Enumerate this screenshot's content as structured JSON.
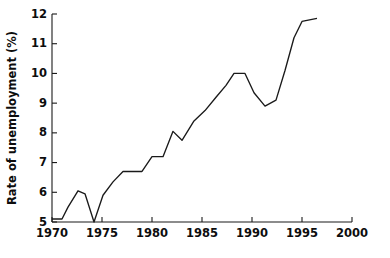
{
  "chart_data": {
    "type": "line",
    "title": "",
    "xlabel": "",
    "ylabel": "Rate of unemployment (%)",
    "xlim": [
      1970,
      2000
    ],
    "ylim": [
      5,
      12
    ],
    "grid": false,
    "legend": "none",
    "xticks": [
      1970,
      1975,
      1980,
      1985,
      1990,
      1995,
      2000
    ],
    "xtick_labels": [
      "1970",
      "1975",
      "1980",
      "1985",
      "1990",
      "1995",
      "2000"
    ],
    "yticks": [
      5,
      6,
      7,
      8,
      9,
      10,
      11,
      12
    ],
    "ytick_labels": [
      "5",
      "6",
      "7",
      "8",
      "9",
      "10",
      "11",
      "12"
    ],
    "series": [
      {
        "name": "Rate of unemployment",
        "color": "#1a1a1a",
        "x": [
          1970,
          1971,
          1971.6,
          1972.6,
          1973.3,
          1974.2,
          1975.1,
          1976.1,
          1977.1,
          1979.0,
          1980.0,
          1981.1,
          1982.1,
          1983.0,
          1984.2,
          1985.3,
          1986.4,
          1987.4,
          1988.2,
          1989.3,
          1990.2,
          1991.3,
          1992.4,
          1993.3,
          1994.2,
          1995.0,
          1996.5
        ],
        "y": [
          5.1,
          5.1,
          5.5,
          6.05,
          5.95,
          5.0,
          5.9,
          6.35,
          6.7,
          6.7,
          7.2,
          7.2,
          8.05,
          7.75,
          8.4,
          8.75,
          9.2,
          9.6,
          10.0,
          10.0,
          9.35,
          8.9,
          9.1,
          10.1,
          11.2,
          11.75,
          11.85
        ]
      }
    ]
  },
  "axes_geometry": {
    "left_px": 52,
    "right_px": 352,
    "top_px": 14,
    "bottom_px": 222,
    "tick_len_px": 5
  }
}
